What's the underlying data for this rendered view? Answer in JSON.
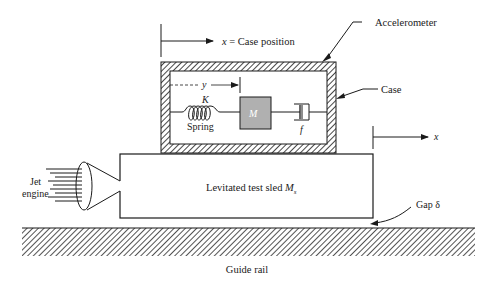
{
  "diagram": {
    "labels": {
      "case_position_var": "x",
      "case_position_text": " = Case position",
      "accelerometer": "Accelerometer",
      "case": "Case",
      "y_var": "y",
      "spring_const": "K",
      "spring": "Spring",
      "mass": "M",
      "damper": "f",
      "sled_x": "x",
      "jet": "Jet",
      "engine": "engine",
      "sled": "Levitated test sled ",
      "sled_mass": "M",
      "sled_mass_sub": "s",
      "gap": "Gap δ",
      "rail": "Guide rail"
    },
    "colors": {
      "line": "#1a1a1a",
      "mass_fill": "#b0b0b0",
      "background": "#ffffff"
    }
  }
}
